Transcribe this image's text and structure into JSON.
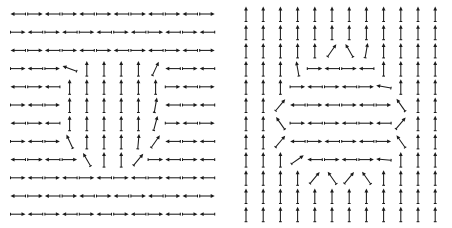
{
  "figure": {
    "title": "",
    "type": "vector-field-pair",
    "background_color": "#ffffff",
    "arrow_color": "#1a1a1a",
    "width": 452,
    "height": 228
  },
  "panels": [
    {
      "name": "left-panel",
      "label": "",
      "origin_x": 0,
      "origin_y": 0,
      "width": 226,
      "height": 228,
      "grid": {
        "cols": 12,
        "rows": 12,
        "x0": 18,
        "y0": 14,
        "dx": 17.2,
        "dy": 18.2
      },
      "arrow_length": 15,
      "description": "in-plane magnetization: predominantly horizontal alternating antiparallel stripes with a central region of out-of-stripe vertical alignment",
      "angles_deg": [
        [
          180,
          0,
          180,
          0,
          180,
          0,
          180,
          0,
          180,
          0,
          180,
          0
        ],
        [
          0,
          180,
          0,
          180,
          0,
          180,
          0,
          180,
          0,
          180,
          0,
          180
        ],
        [
          180,
          0,
          180,
          0,
          180,
          0,
          180,
          0,
          180,
          0,
          180,
          0
        ],
        [
          0,
          180,
          0,
          160,
          90,
          90,
          90,
          90,
          65,
          180,
          0,
          180
        ],
        [
          180,
          0,
          180,
          90,
          90,
          90,
          90,
          90,
          90,
          0,
          180,
          0
        ],
        [
          0,
          180,
          0,
          90,
          90,
          90,
          90,
          90,
          80,
          180,
          0,
          180
        ],
        [
          180,
          0,
          180,
          90,
          90,
          90,
          90,
          90,
          75,
          0,
          180,
          0
        ],
        [
          0,
          180,
          0,
          115,
          90,
          90,
          90,
          85,
          55,
          180,
          0,
          180
        ],
        [
          180,
          0,
          180,
          0,
          120,
          90,
          90,
          50,
          0,
          180,
          0,
          180
        ],
        [
          0,
          180,
          0,
          180,
          0,
          180,
          0,
          180,
          0,
          180,
          0,
          180
        ],
        [
          180,
          0,
          180,
          0,
          180,
          0,
          180,
          0,
          180,
          0,
          180,
          0
        ],
        [
          0,
          180,
          0,
          180,
          0,
          180,
          0,
          180,
          0,
          180,
          0,
          180
        ]
      ]
    },
    {
      "name": "right-panel",
      "label": "",
      "origin_x": 226,
      "origin_y": 0,
      "width": 226,
      "height": 228,
      "grid": {
        "cols": 12,
        "rows": 12,
        "x0": 20,
        "y0": 14,
        "dx": 17.2,
        "dy": 18.2
      },
      "arrow_length": 15,
      "description": "out-of-plane magnetization: predominantly vertical up arrows with a central lens-shaped region of horizontal antiparallel alignment",
      "angles_deg": [
        [
          90,
          90,
          90,
          90,
          90,
          90,
          90,
          90,
          90,
          90,
          90,
          90
        ],
        [
          90,
          90,
          90,
          90,
          90,
          90,
          90,
          90,
          90,
          90,
          90,
          90
        ],
        [
          90,
          90,
          90,
          90,
          90,
          55,
          120,
          80,
          90,
          90,
          90,
          90
        ],
        [
          90,
          90,
          90,
          100,
          0,
          180,
          0,
          180,
          90,
          90,
          90,
          90
        ],
        [
          90,
          90,
          90,
          0,
          180,
          0,
          180,
          0,
          170,
          90,
          90,
          90
        ],
        [
          90,
          90,
          50,
          180,
          0,
          180,
          0,
          180,
          0,
          125,
          90,
          90
        ],
        [
          90,
          90,
          125,
          0,
          180,
          0,
          180,
          0,
          180,
          50,
          90,
          90
        ],
        [
          90,
          90,
          50,
          180,
          0,
          180,
          0,
          180,
          0,
          125,
          90,
          90
        ],
        [
          90,
          90,
          90,
          35,
          180,
          0,
          180,
          0,
          175,
          90,
          90,
          90
        ],
        [
          90,
          90,
          90,
          90,
          50,
          125,
          50,
          125,
          90,
          90,
          90,
          90
        ],
        [
          90,
          90,
          90,
          90,
          90,
          90,
          90,
          90,
          90,
          90,
          90,
          90
        ],
        [
          90,
          90,
          90,
          90,
          90,
          90,
          90,
          90,
          90,
          90,
          90,
          90
        ]
      ]
    }
  ]
}
